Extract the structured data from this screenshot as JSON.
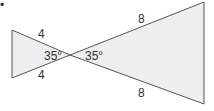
{
  "figure": {
    "bullet": "•",
    "fill_color": "#eeeeee",
    "stroke_color": "#555555",
    "left_triangle": {
      "side_top": "4",
      "side_bottom": "4",
      "angle": "35°"
    },
    "right_triangle": {
      "side_top": "8",
      "side_bottom": "8",
      "angle": "35°"
    }
  }
}
